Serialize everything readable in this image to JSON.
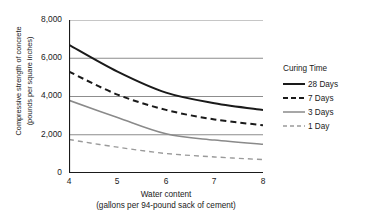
{
  "chart_data": {
    "type": "line",
    "title": "",
    "xlabel": "Water content (gallons per 94-pound sack of cement)",
    "xlabel_line1": "Water content",
    "xlabel_line2": "(gallons per 94-pound sack of cement)",
    "ylabel": "Compressive strength of concrete (pounds per square inches)",
    "ylabel_line1": "Compressive strength of concrete",
    "ylabel_line2": "(pounds per square inches)",
    "x": [
      4,
      5,
      6,
      7,
      8
    ],
    "xlim": [
      4,
      8
    ],
    "ylim": [
      0,
      8000
    ],
    "xticks": [
      "4",
      "5",
      "6",
      "7",
      "8"
    ],
    "yticks": [
      "0",
      "2,000",
      "4,000",
      "6,000",
      "8,000"
    ],
    "ytick_values": [
      0,
      2000,
      4000,
      6000,
      8000
    ],
    "gridlines": [
      2000,
      4000,
      6000,
      8000
    ],
    "grid": "horizontal",
    "legend_position": "right",
    "legend_title": "Curing Time",
    "series": [
      {
        "name": "28 Days",
        "values": [
          6700,
          5300,
          4200,
          3650,
          3300
        ],
        "style": "solid",
        "color": "#1a1a1a",
        "width": 2.0
      },
      {
        "name": "7 Days",
        "values": [
          5300,
          4100,
          3300,
          2800,
          2500
        ],
        "style": "dashed",
        "color": "#1a1a1a",
        "width": 2.0
      },
      {
        "name": "3 Days",
        "values": [
          3800,
          2900,
          2050,
          1720,
          1500
        ],
        "style": "solid",
        "color": "#8a8a8a",
        "width": 1.5
      },
      {
        "name": "1 Day",
        "values": [
          1750,
          1350,
          1020,
          840,
          700
        ],
        "style": "dashed",
        "color": "#9a9a9a",
        "width": 1.4
      }
    ]
  },
  "colors": {
    "axis": "#1a1a1a",
    "grid": "#8d8d8d",
    "text": "#1a1a1a",
    "background": "#ffffff"
  }
}
